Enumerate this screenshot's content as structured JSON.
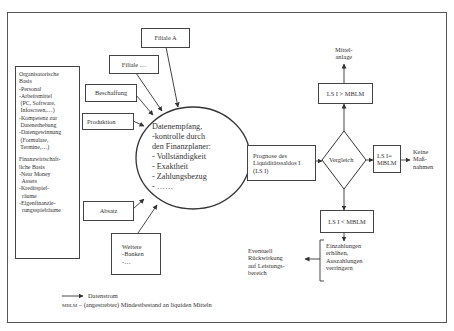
{
  "diagram": {
    "left_box": {
      "organisational": "Organisatorische\nBasis\n-Personal\n-Arbeitsmittel\n (PC, Software,\n Infoscreen,…)\n-Kompetenz zur\n Datenerhebung\n-Datengewinnung\n (Formulare,\n Termine,…)",
      "financial": "Finanzwirtschaft-\nliche Basis\n-Near Money\n  Assets\n-Kreditspiel-\n  räume\n-Eigenfinanzie-\n  rungsspielräume"
    },
    "sources": {
      "filiale_a": "Filiale A",
      "filiale_more": "Filiale …",
      "beschaffung": "Beschaffung",
      "produktion": "Produktion",
      "absatz": "Absatz",
      "weitere": "Weitere\n-Banken\n-…"
    },
    "circle": "Datenempfang,\n-kontrolle durch\nden Finanzplaner:\n- Vollständigkeit\n- Exaktheit\n- Zahlungsbezug\n- ……",
    "prognose": "Prognose des\nLiquiditätssaldos I\n(LS I)",
    "decision": "Vergleich",
    "greater": "LS I > MBLM",
    "greater_result": "Mittel-\nanlage",
    "equal": "LS I=\nMBLM",
    "equal_result": "Keine\nMaß-\nnahmen",
    "less": "LS I < MBLM",
    "less_action": "Einzahlungen\nerhöhen,\nAuszahlungen\nverringern",
    "less_result": "Eventuell\nRückwirkung\nauf Leistungs-\nbereich"
  },
  "legend": {
    "arrow_label": "Datenstrom",
    "mblm_abbr": "MBLM",
    "mblm_def": " – (angestrebter) Mindestbestand an liquiden Mitteln"
  }
}
